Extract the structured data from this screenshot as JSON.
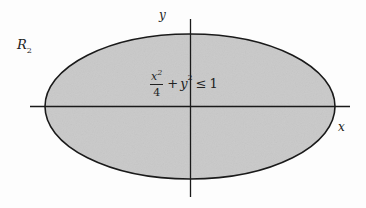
{
  "figure": {
    "region_label": "R",
    "region_subscript": "2",
    "x_axis_label": "x",
    "y_axis_label": "y",
    "inequality": {
      "numerator_var": "x",
      "numerator_exp": "2",
      "denominator": "4",
      "plus": "+",
      "term_var": "y",
      "term_exp": "2",
      "relation": "≤",
      "rhs": "1"
    },
    "ellipse": {
      "semi_major": 2,
      "semi_minor": 1
    },
    "colors": {
      "fill": "#c8c8c8",
      "stroke": "#1a1a1a",
      "background": "#fdfdfd"
    }
  }
}
